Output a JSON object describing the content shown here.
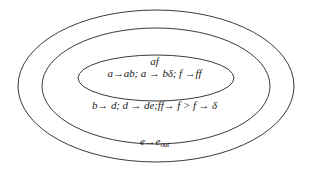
{
  "diagram": {
    "type": "nested-ellipses",
    "background_color": "#ffffff",
    "stroke_color": "#3a3a3a",
    "text_color": "#1c1c1c",
    "regions": [
      {
        "name": "outer-ellipse",
        "label": "e→e",
        "label_subscript": "out",
        "cx": 156,
        "cy": 86,
        "rx": 138,
        "ry": 76
      },
      {
        "name": "middle-ellipse",
        "label": "b→ d; d → de;ff→ f > f → δ",
        "cx": 156,
        "cy": 86,
        "rx": 114,
        "ry": 58
      },
      {
        "name": "inner-ellipse",
        "symbol": "af",
        "label": "a→ab; a → bδ; f →ff",
        "cx": 156,
        "cy": 78,
        "rx": 78,
        "ry": 23
      }
    ]
  }
}
